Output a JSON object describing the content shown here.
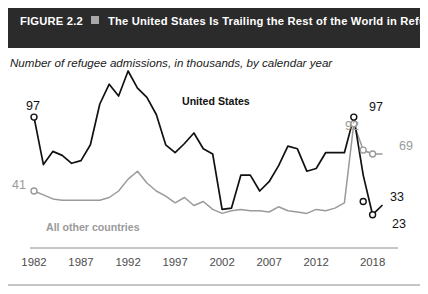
{
  "header": {
    "figure_number": "FIGURE 2.2",
    "separator_icon": "gray-square",
    "title": "The United States Is Trailing the Rest of the World in Refugee Resettlement",
    "bar_color": "#2b2b2b",
    "text_color": "#ffffff"
  },
  "subtitle": "Number of refugee admissions, in thousands, by calendar year",
  "series_labels": {
    "us": "United States",
    "other": "All other countries"
  },
  "annotations": {
    "us_start": "97",
    "other_start": "41",
    "other_peak": "92",
    "us_peak": "97",
    "other_end": "69",
    "us_mid_end": "33",
    "us_end": "23"
  },
  "colors": {
    "us_line": "#111111",
    "other_line": "#9a9a9a",
    "axis": "#8c8c8c",
    "rule": "#8c8c8c",
    "background": "#ffffff"
  },
  "chart_data": {
    "type": "line",
    "title": "The United States Is Trailing the Rest of the World in Refugee Resettlement",
    "subtitle": "Number of refugee admissions, in thousands, by calendar year",
    "xlabel": "",
    "ylabel": "Number of refugee admissions (thousands)",
    "xlim": [
      1982,
      2019
    ],
    "ylim": [
      0,
      110
    ],
    "grid": false,
    "legend": "inline-series-labels",
    "tick_labels": [
      "1982",
      "1987",
      "1992",
      "1997",
      "2002",
      "2007",
      "2012",
      "2018"
    ],
    "x": [
      1982,
      1983,
      1984,
      1985,
      1986,
      1987,
      1988,
      1989,
      1990,
      1991,
      1992,
      1993,
      1994,
      1995,
      1996,
      1997,
      1998,
      1999,
      2000,
      2001,
      2002,
      2003,
      2004,
      2005,
      2006,
      2007,
      2008,
      2009,
      2010,
      2011,
      2012,
      2013,
      2014,
      2015,
      2016,
      2017,
      2018,
      2019
    ],
    "series": [
      {
        "name": "United States",
        "color": "#111111",
        "values": [
          97,
          61,
          71,
          68,
          62,
          64,
          76,
          107,
          122,
          113,
          132,
          119,
          112,
          99,
          76,
          70,
          77,
          85,
          73,
          69,
          27,
          28,
          53,
          53,
          41,
          48,
          60,
          75,
          73,
          56,
          58,
          70,
          70,
          70,
          97,
          53,
          23,
          30
        ],
        "markers": [
          {
            "x": 1982,
            "y": 97,
            "label": "97"
          },
          {
            "x": 2016,
            "y": 97,
            "label": "97"
          },
          {
            "x": 2017,
            "y": 33,
            "label": "33"
          },
          {
            "x": 2018,
            "y": 23,
            "label": "23"
          }
        ]
      },
      {
        "name": "All other countries",
        "color": "#9a9a9a",
        "values": [
          41,
          38,
          35,
          34,
          34,
          34,
          34,
          34,
          36,
          41,
          50,
          56,
          47,
          41,
          37,
          32,
          36,
          30,
          33,
          27,
          24,
          26,
          27,
          26,
          26,
          25,
          29,
          26,
          25,
          24,
          27,
          26,
          28,
          32,
          92,
          72,
          69,
          69
        ],
        "markers": [
          {
            "x": 1982,
            "y": 41,
            "label": "41"
          },
          {
            "x": 2016,
            "y": 92,
            "label": "92"
          },
          {
            "x": 2018,
            "y": 69,
            "label": "69"
          }
        ]
      }
    ]
  }
}
